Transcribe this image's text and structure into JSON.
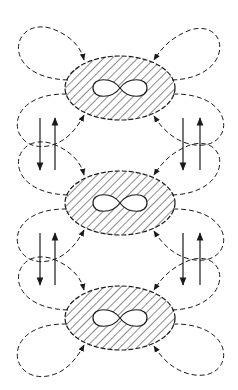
{
  "diagram": {
    "colors": {
      "stroke": "#1a1a1a",
      "background": "#ffffff"
    },
    "nodes": [
      {
        "id": "domain-1",
        "cx": 120,
        "cy": 88,
        "rx": 55,
        "ry": 32,
        "symbol": "∞",
        "fill": "hatched"
      },
      {
        "id": "domain-2",
        "cx": 120,
        "cy": 203,
        "rx": 55,
        "ry": 32,
        "symbol": "∞",
        "fill": "hatched"
      },
      {
        "id": "domain-3",
        "cx": 120,
        "cy": 318,
        "rx": 55,
        "ry": 32,
        "symbol": "∞",
        "fill": "hatched"
      }
    ],
    "vertical_arrow_pairs": [
      {
        "x_down": 40,
        "x_up": 55,
        "y_top": 118,
        "y_bottom": 170,
        "side": "left"
      },
      {
        "x_down": 183,
        "x_up": 200,
        "y_top": 118,
        "y_bottom": 170,
        "side": "right"
      },
      {
        "x_down": 40,
        "x_up": 55,
        "y_top": 233,
        "y_bottom": 285,
        "side": "left"
      },
      {
        "x_down": 183,
        "x_up": 200,
        "y_top": 233,
        "y_bottom": 285,
        "side": "right"
      }
    ]
  }
}
